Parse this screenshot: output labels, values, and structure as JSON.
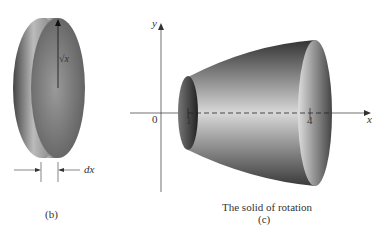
{
  "panel_b": {
    "radius_label": "√x",
    "thickness_label": "dx",
    "caption": "(b)"
  },
  "panel_c": {
    "y_axis_label": "y",
    "x_axis_label": "x",
    "origin_label": "0",
    "tick_1": "1",
    "tick_4": "4",
    "caption_title": "The solid of rotation",
    "caption": "(c)"
  }
}
